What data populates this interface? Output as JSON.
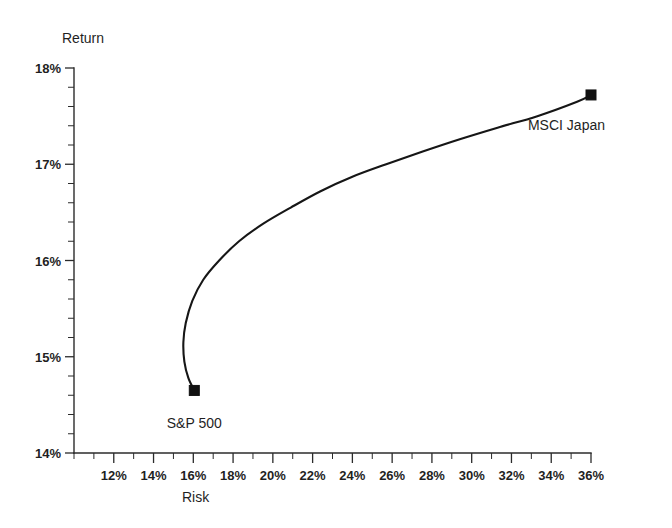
{
  "chart_data": {
    "type": "line",
    "title": "",
    "subtitle": "",
    "xlabel": "Risk",
    "ylabel": "Return",
    "xlim": [
      10,
      36
    ],
    "ylim": [
      14,
      18
    ],
    "grid": false,
    "legend_position": "none",
    "x_tick_labels": [
      "12%",
      "14%",
      "16%",
      "18%",
      "20%",
      "22%",
      "24%",
      "26%",
      "28%",
      "30%",
      "32%",
      "34%",
      "36%"
    ],
    "x_tick_values": [
      12,
      14,
      16,
      18,
      20,
      22,
      24,
      26,
      28,
      30,
      32,
      34,
      36
    ],
    "x_minor_step": 1,
    "y_tick_labels": [
      "14%",
      "15%",
      "16%",
      "17%",
      "18%"
    ],
    "y_tick_values": [
      14,
      15,
      16,
      17,
      18
    ],
    "y_minor_step": 0.2,
    "series": [
      {
        "name": "Efficient frontier",
        "x": [
          16.05,
          15.75,
          15.55,
          15.5,
          15.62,
          15.95,
          16.5,
          17.3,
          18.3,
          19.5,
          20.9,
          22.4,
          24.0,
          25.7,
          27.5,
          29.4,
          31.3,
          33.3,
          35.3,
          36.0
        ],
        "y": [
          14.65,
          14.78,
          14.95,
          15.15,
          15.35,
          15.58,
          15.8,
          16.0,
          16.2,
          16.38,
          16.55,
          16.72,
          16.87,
          17.0,
          17.13,
          17.26,
          17.38,
          17.5,
          17.65,
          17.72
        ]
      }
    ],
    "annotations": [
      {
        "label": "S&P 500",
        "x": 16.05,
        "y": 14.65,
        "marker": "square",
        "label_position": "below"
      },
      {
        "label": "MSCI Japan",
        "x": 36.0,
        "y": 17.72,
        "marker": "square",
        "label_position": "below-right"
      }
    ]
  }
}
